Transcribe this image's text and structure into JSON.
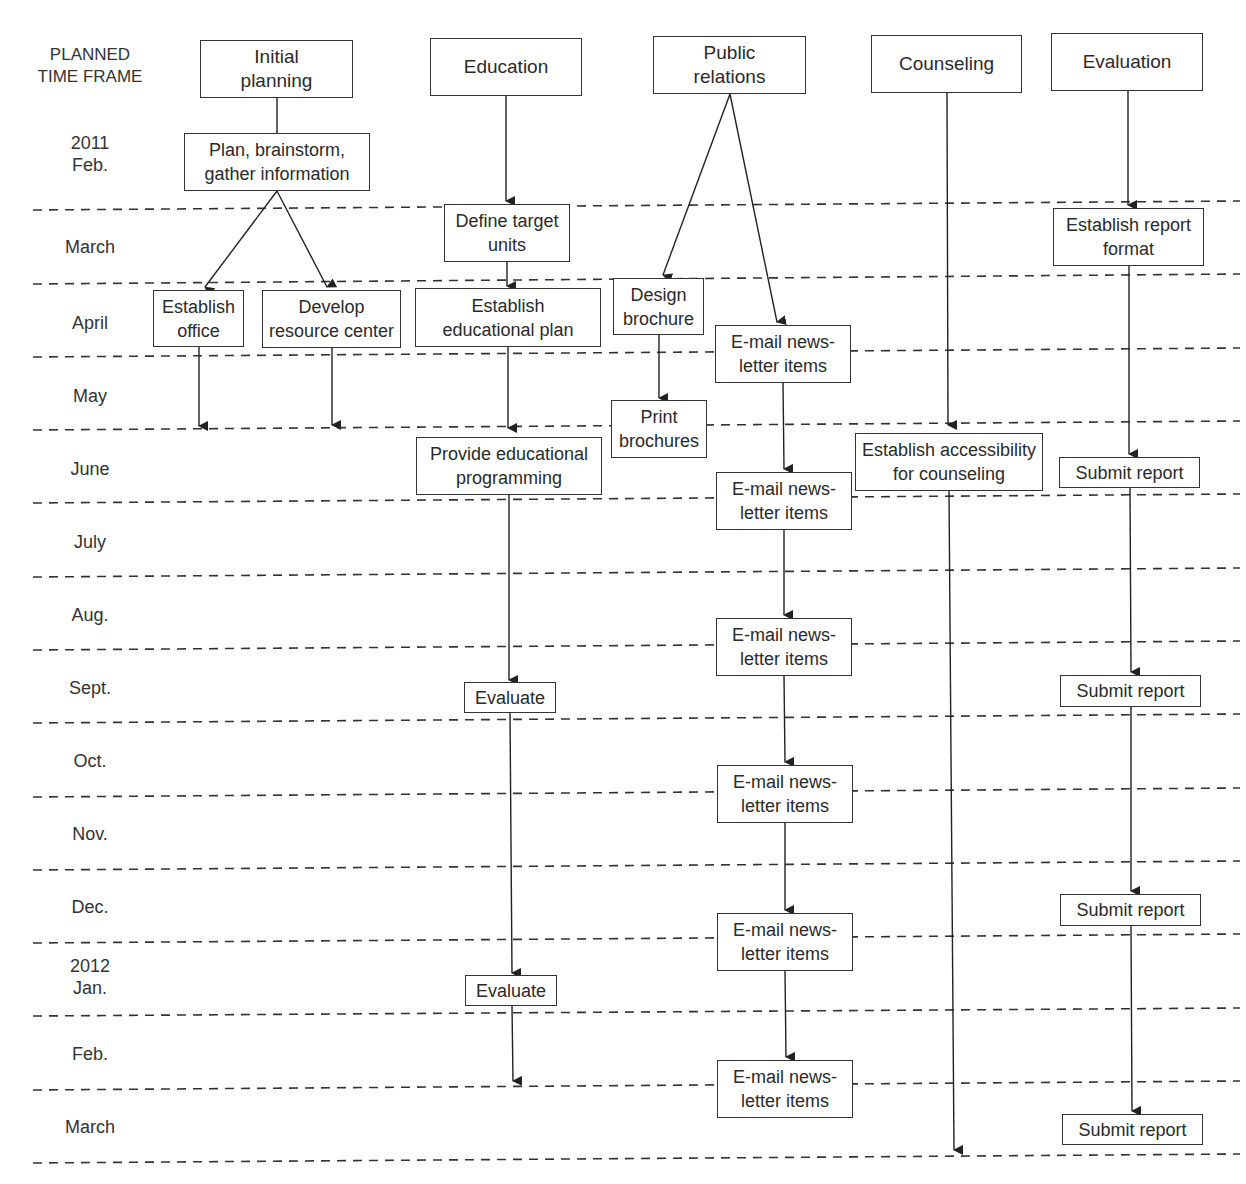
{
  "header": {
    "time_frame_label": "PLANNED\nTIME FRAME"
  },
  "months": [
    {
      "label": "2011\nFeb."
    },
    {
      "label": "March"
    },
    {
      "label": "April"
    },
    {
      "label": "May"
    },
    {
      "label": "June"
    },
    {
      "label": "July"
    },
    {
      "label": "Aug."
    },
    {
      "label": "Sept."
    },
    {
      "label": "Oct."
    },
    {
      "label": "Nov."
    },
    {
      "label": "Dec."
    },
    {
      "label": "2012\nJan."
    },
    {
      "label": "Feb."
    },
    {
      "label": "March"
    }
  ],
  "tracks": {
    "initial_planning": {
      "title": "Initial\nplanning",
      "steps": [
        {
          "label": "Plan, brainstorm,\ngather information",
          "month": "2011 Feb."
        },
        {
          "label": "Establish\noffice",
          "month": "April"
        },
        {
          "label": "Develop\nresource center",
          "month": "April"
        }
      ]
    },
    "education": {
      "title": "Education",
      "steps": [
        {
          "label": "Define target\nunits",
          "month": "March"
        },
        {
          "label": "Establish\neducational plan",
          "month": "April"
        },
        {
          "label": "Provide educational\nprogramming",
          "month": "June"
        },
        {
          "label": "Evaluate",
          "month": "Sept."
        },
        {
          "label": "Evaluate",
          "month": "2012 Jan."
        }
      ]
    },
    "public_relations": {
      "title": "Public\nrelations",
      "steps": [
        {
          "label": "Design\nbrochure",
          "month": "April"
        },
        {
          "label": "Print\nbrochures",
          "month": "May"
        },
        {
          "label": "E-mail news-\nletter items",
          "month": "April/May"
        },
        {
          "label": "E-mail news-\nletter items",
          "month": "June/July"
        },
        {
          "label": "E-mail news-\nletter items",
          "month": "Aug."
        },
        {
          "label": "E-mail news-\nletter items",
          "month": "Oct./Nov."
        },
        {
          "label": "E-mail news-\nletter items",
          "month": "Dec./Jan."
        },
        {
          "label": "E-mail news-\nletter items",
          "month": "Feb./March"
        }
      ]
    },
    "counseling": {
      "title": "Counseling",
      "steps": [
        {
          "label": "Establish accessibility\nfor counseling",
          "month": "June"
        }
      ]
    },
    "evaluation": {
      "title": "Evaluation",
      "steps": [
        {
          "label": "Establish report\nformat",
          "month": "March"
        },
        {
          "label": "Submit report",
          "month": "June"
        },
        {
          "label": "Submit report",
          "month": "Sept."
        },
        {
          "label": "Submit report",
          "month": "Dec."
        },
        {
          "label": "Submit report",
          "month": "March"
        }
      ]
    }
  },
  "style": {
    "line_color": "#333333",
    "background": "#ffffff"
  }
}
